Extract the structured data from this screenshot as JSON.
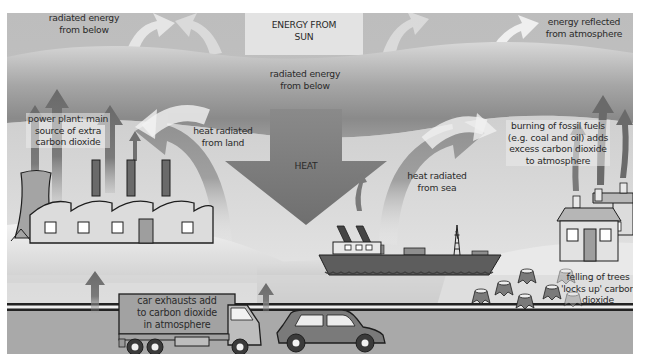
{
  "colors": {
    "sky_top": "#b9b9b9",
    "atmosphere_band_dark": "#8c8c8c",
    "atmosphere_band_light": "#d6d6d6",
    "ground_light": "#e4e4e4",
    "sea": "#c9c9c9",
    "road": "#a8a8a8",
    "arrow_dark": "#6e6e6e",
    "arrow_light": "#f2f2f2",
    "building_fill": "#dcdcdc",
    "outline": "#1e1e1e"
  },
  "labels": {
    "energy_from_sun": [
      "ENERGY FROM",
      "SUN"
    ],
    "radiated_top_left": [
      "radiated energy",
      "from below"
    ],
    "radiated_center": [
      "radiated energy",
      "from below"
    ],
    "energy_reflected": [
      "energy reflected",
      "from atmosphere"
    ],
    "power_plant": [
      "power plant: main",
      "source of extra",
      "carbon dioxide"
    ],
    "heat_land": [
      "heat radiated",
      "from land"
    ],
    "heat": [
      "HEAT"
    ],
    "heat_sea": [
      "heat radiated",
      "from sea"
    ],
    "fossil_fuels": [
      "burning of fossil fuels",
      "(e.g. coal and oil) adds",
      "excess carbon dioxide",
      "to atmosphere"
    ],
    "car_exhausts": [
      "car exhausts add",
      "to carbon dioxide",
      "in atmosphere"
    ],
    "felling_trees": [
      "felling of trees",
      "'locks up' carbon",
      "dioxide"
    ]
  },
  "icons": {
    "power_plant": "factory-icon",
    "cooling_tower": "cooling-tower-icon",
    "ship": "ship-icon",
    "houses": "house-icon",
    "truck": "truck-icon",
    "car": "car-icon",
    "tree_stumps": "tree-stump-icon",
    "heat_arrow": "arrow-down-icon",
    "co2_arrows": "arrow-up-icon"
  }
}
